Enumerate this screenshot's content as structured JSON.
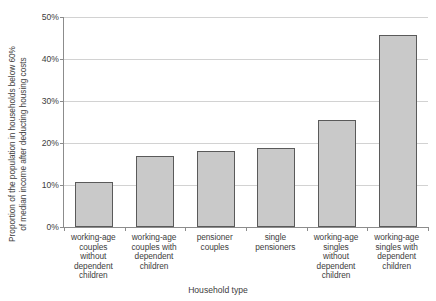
{
  "chart_data": {
    "type": "bar",
    "title": "",
    "xlabel": "Household type",
    "ylabel_line1": "Proportion of the population in households below 60%",
    "ylabel_line2": "of median income after deducting housing costs",
    "categories": [
      "working-age couples without dependent children",
      "working-age couples with dependent children",
      "pensioner couples",
      "single pensioners",
      "working-age singles without dependent children",
      "working-age singles with dependent children"
    ],
    "category_lines": [
      [
        "working-age",
        "couples",
        "without",
        "dependent",
        "children"
      ],
      [
        "working-age",
        "couples with",
        "dependent",
        "children"
      ],
      [
        "pensioner",
        "couples"
      ],
      [
        "single",
        "pensioners"
      ],
      [
        "working-age",
        "singles",
        "without",
        "dependent",
        "children"
      ],
      [
        "working-age",
        "singles with",
        "dependent",
        "children"
      ]
    ],
    "values": [
      10.7,
      16.8,
      18.0,
      18.9,
      25.4,
      45.8
    ],
    "ylim": [
      0,
      50
    ],
    "ytick_values": [
      0,
      10,
      20,
      30,
      40,
      50
    ],
    "ytick_labels": [
      "0%",
      "10%",
      "20%",
      "30%",
      "40%",
      "50%"
    ],
    "grid": true,
    "legend": "none",
    "colors": {
      "bar_fill": "#c9c9c9",
      "bar_stroke": "#5a5a5a",
      "axis": "#8c8c8c",
      "gridline": "#d2d2d2",
      "text": "#3d3d3d",
      "background": "#ffffff"
    }
  }
}
